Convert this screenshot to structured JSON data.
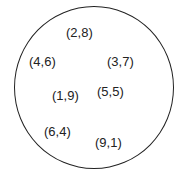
{
  "diagram": {
    "type": "set",
    "boundary": "circle",
    "elements": [
      {
        "label": "(2,8)",
        "x": 66,
        "y": 26
      },
      {
        "label": "(4,6)",
        "x": 29,
        "y": 55
      },
      {
        "label": "(3,7)",
        "x": 107,
        "y": 55
      },
      {
        "label": "(1,9)",
        "x": 52,
        "y": 89
      },
      {
        "label": "(5,5)",
        "x": 97,
        "y": 85
      },
      {
        "label": "(6,4)",
        "x": 44,
        "y": 125
      },
      {
        "label": "(9,1)",
        "x": 95,
        "y": 136
      }
    ]
  }
}
